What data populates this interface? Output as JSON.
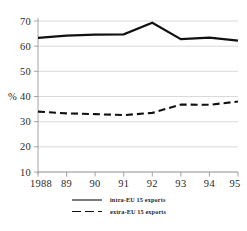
{
  "chart_data": {
    "type": "line",
    "title": "",
    "xlabel": "",
    "ylabel": "%",
    "x": [
      "1988",
      "89",
      "90",
      "91",
      "92",
      "93",
      "94",
      "95"
    ],
    "categories": [
      "1988",
      "89",
      "90",
      "91",
      "92",
      "93",
      "94",
      "95"
    ],
    "xtick_labels": [
      "1988",
      "89",
      "90",
      "91",
      "92",
      "93",
      "94",
      "95"
    ],
    "ytick_labels": [
      "70",
      "60",
      "50",
      "% 40",
      "30",
      "20",
      "10"
    ],
    "ytick_values": [
      70,
      60,
      50,
      40,
      30,
      20,
      10
    ],
    "ylim": [
      7,
      72
    ],
    "xlim": [
      1988,
      1995
    ],
    "grid": "horizontal",
    "legend_position": "bottom-center",
    "series": [
      {
        "name": "intra-EU 15 exports",
        "style": "solid",
        "color": "#111111",
        "values": [
          63.3,
          64.2,
          64.6,
          64.7,
          69.3,
          62.8,
          63.4,
          62.2
        ]
      },
      {
        "name": "extra-EU 15 exports",
        "style": "dashed",
        "color": "#111111",
        "values": [
          34.0,
          33.3,
          33.0,
          32.6,
          33.5,
          36.8,
          36.7,
          38.0
        ]
      }
    ]
  },
  "axis": {
    "percent_label": "%",
    "y_labels": {
      "t70": "70",
      "t60": "60",
      "t50": "50",
      "t40": "% 40",
      "t30": "30",
      "t20": "20",
      "t10": "10"
    },
    "x_labels": {
      "x1988": "1988",
      "x89": "89",
      "x90": "90",
      "x91": "91",
      "x92": "92",
      "x93": "93",
      "x94": "94",
      "x95": "95"
    }
  },
  "legend": {
    "items": [
      {
        "label": "intra-EU 15 exports",
        "style": "solid"
      },
      {
        "label": "extra-EU 15 exports",
        "style": "dashed"
      }
    ]
  },
  "colors": {
    "series": "#111111",
    "grid": "#cfcfcf",
    "axis": "#9a9a9a",
    "background": "#ffffff",
    "text": "#1a1a1a"
  }
}
